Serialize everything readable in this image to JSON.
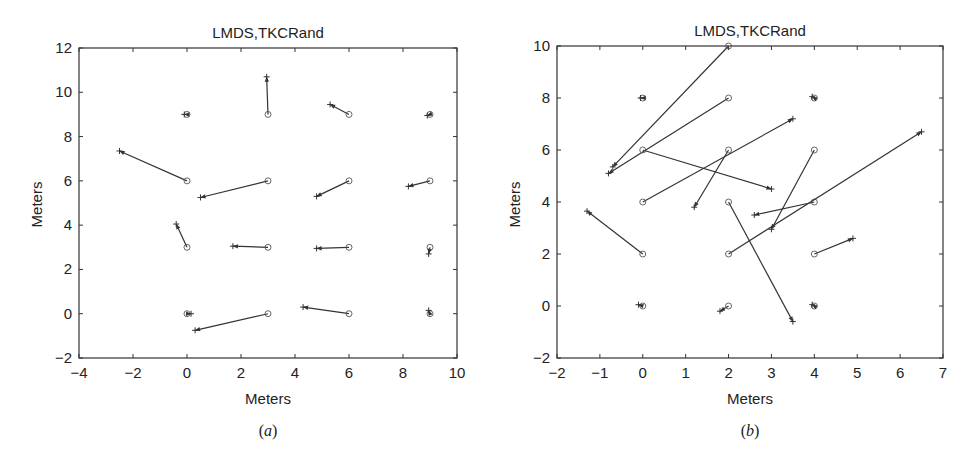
{
  "chart_data": [
    {
      "type": "quiver",
      "panel": "a",
      "caption_letter": "a",
      "title": "LMDS,TKCRand",
      "xlabel": "Meters",
      "ylabel": "Meters",
      "xlim": [
        -4,
        10
      ],
      "ylim": [
        -2,
        12
      ],
      "xticks": [
        -4,
        -2,
        0,
        2,
        4,
        6,
        8,
        10
      ],
      "yticks": [
        -2,
        0,
        2,
        4,
        6,
        8,
        10,
        12
      ],
      "grid": false,
      "markers": {
        "true_position": "circle",
        "estimate": "arrow-plus"
      },
      "vectors": [
        {
          "from": [
            0,
            9
          ],
          "to": [
            -0.1,
            9.0
          ]
        },
        {
          "from": [
            3,
            9
          ],
          "to": [
            2.95,
            10.7
          ]
        },
        {
          "from": [
            6,
            9
          ],
          "to": [
            5.3,
            9.45
          ]
        },
        {
          "from": [
            9,
            9
          ],
          "to": [
            8.9,
            8.95
          ]
        },
        {
          "from": [
            0,
            6
          ],
          "to": [
            -2.5,
            7.35
          ]
        },
        {
          "from": [
            3,
            6
          ],
          "to": [
            0.5,
            5.25
          ]
        },
        {
          "from": [
            6,
            6
          ],
          "to": [
            4.8,
            5.3
          ]
        },
        {
          "from": [
            9,
            6
          ],
          "to": [
            8.2,
            5.75
          ]
        },
        {
          "from": [
            0,
            3
          ],
          "to": [
            -0.4,
            4.05
          ]
        },
        {
          "from": [
            3,
            3
          ],
          "to": [
            1.7,
            3.05
          ]
        },
        {
          "from": [
            6,
            3
          ],
          "to": [
            4.8,
            2.95
          ]
        },
        {
          "from": [
            9,
            3
          ],
          "to": [
            8.95,
            2.7
          ]
        },
        {
          "from": [
            0,
            0
          ],
          "to": [
            0.15,
            0.0
          ]
        },
        {
          "from": [
            3,
            0
          ],
          "to": [
            0.3,
            -0.75
          ]
        },
        {
          "from": [
            6,
            0
          ],
          "to": [
            4.3,
            0.3
          ]
        },
        {
          "from": [
            9,
            0
          ],
          "to": [
            8.95,
            0.15
          ]
        }
      ]
    },
    {
      "type": "quiver",
      "panel": "b",
      "caption_letter": "b",
      "title": "LMDS,TKCRand",
      "xlabel": "Meters",
      "ylabel": "Meters",
      "xlim": [
        -2,
        7
      ],
      "ylim": [
        -2,
        10
      ],
      "xticks": [
        -2,
        -1,
        0,
        1,
        2,
        3,
        4,
        5,
        6,
        7
      ],
      "yticks": [
        -2,
        0,
        2,
        4,
        6,
        8,
        10
      ],
      "grid": false,
      "markers": {
        "true_position": "circle",
        "estimate": "arrow-plus"
      },
      "vectors": [
        {
          "from": [
            2,
            10
          ],
          "to": [
            -0.7,
            5.35
          ]
        },
        {
          "from": [
            0,
            8
          ],
          "to": [
            -0.05,
            8.0
          ]
        },
        {
          "from": [
            2,
            8
          ],
          "to": [
            -0.8,
            5.1
          ]
        },
        {
          "from": [
            4,
            8
          ],
          "to": [
            3.95,
            8.05
          ]
        },
        {
          "from": [
            0,
            6
          ],
          "to": [
            3.0,
            4.5
          ]
        },
        {
          "from": [
            2,
            6
          ],
          "to": [
            1.2,
            3.8
          ]
        },
        {
          "from": [
            4,
            6
          ],
          "to": [
            3.0,
            2.95
          ]
        },
        {
          "from": [
            0,
            4
          ],
          "to": [
            3.5,
            7.2
          ]
        },
        {
          "from": [
            2,
            4
          ],
          "to": [
            3.5,
            -0.6
          ]
        },
        {
          "from": [
            4,
            4
          ],
          "to": [
            2.6,
            3.5
          ]
        },
        {
          "from": [
            0,
            2
          ],
          "to": [
            -1.3,
            3.65
          ]
        },
        {
          "from": [
            2,
            2
          ],
          "to": [
            6.5,
            6.7
          ]
        },
        {
          "from": [
            4,
            2
          ],
          "to": [
            4.9,
            2.6
          ]
        },
        {
          "from": [
            0,
            0
          ],
          "to": [
            -0.1,
            0.05
          ]
        },
        {
          "from": [
            2,
            0
          ],
          "to": [
            1.8,
            -0.2
          ]
        },
        {
          "from": [
            4,
            0
          ],
          "to": [
            3.95,
            0.05
          ]
        }
      ]
    }
  ],
  "colors": {
    "axis": "#333333",
    "vector": "#333333",
    "marker": "#555555",
    "background": "#ffffff"
  }
}
